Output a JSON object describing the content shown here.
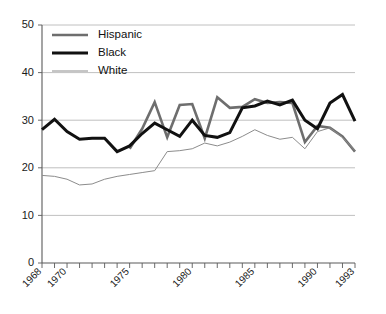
{
  "chart_data": {
    "type": "line",
    "title": "",
    "subtitle": "",
    "xlabel": "",
    "ylabel": "",
    "xlim": [
      1968,
      1993
    ],
    "ylim": [
      0,
      50
    ],
    "yticks": [
      0,
      10,
      20,
      30,
      40,
      50
    ],
    "xticks_labeled": [
      1968,
      1970,
      1975,
      1980,
      1985,
      1990,
      1993
    ],
    "xticks_all": [
      1968,
      1969,
      1970,
      1971,
      1972,
      1973,
      1974,
      1975,
      1976,
      1977,
      1978,
      1979,
      1980,
      1981,
      1982,
      1983,
      1984,
      1985,
      1986,
      1987,
      1988,
      1989,
      1990,
      1991,
      1992,
      1993
    ],
    "grid": "horizontal",
    "legend_position": "top-left",
    "series": [
      {
        "name": "Hispanic",
        "color": "#6e6e6e",
        "width": 2.6,
        "x": [
          1975,
          1976,
          1977,
          1978,
          1979,
          1980,
          1981,
          1982,
          1983,
          1984,
          1985,
          1986,
          1987,
          1988,
          1989,
          1990,
          1991,
          1992,
          1993
        ],
        "values": [
          24.0,
          28.2,
          33.8,
          26.4,
          33.2,
          33.4,
          26.2,
          34.8,
          32.6,
          32.8,
          34.4,
          33.6,
          33.8,
          33.6,
          25.4,
          28.8,
          28.4,
          26.6,
          23.4
        ]
      },
      {
        "name": "Black",
        "color": "#111111",
        "width": 3.0,
        "x": [
          1968,
          1969,
          1970,
          1971,
          1972,
          1973,
          1974,
          1975,
          1976,
          1977,
          1978,
          1979,
          1980,
          1981,
          1982,
          1983,
          1984,
          1985,
          1986,
          1987,
          1988,
          1989,
          1990,
          1991,
          1992,
          1993
        ],
        "values": [
          28.0,
          30.2,
          27.6,
          26.0,
          26.2,
          26.2,
          23.4,
          24.6,
          27.2,
          29.4,
          28.0,
          26.6,
          30.0,
          26.8,
          26.4,
          27.4,
          32.6,
          33.0,
          34.0,
          33.2,
          34.2,
          30.0,
          28.2,
          33.6,
          35.4,
          29.8
        ]
      },
      {
        "name": "White",
        "color": "#8c8c8c",
        "width": 1.0,
        "x": [
          1968,
          1969,
          1970,
          1971,
          1972,
          1973,
          1974,
          1975,
          1976,
          1977,
          1978,
          1979,
          1980,
          1981,
          1982,
          1983,
          1984,
          1985,
          1986,
          1987,
          1988,
          1989,
          1990,
          1991,
          1992,
          1993
        ],
        "values": [
          18.4,
          18.2,
          17.6,
          16.4,
          16.6,
          17.6,
          18.2,
          18.6,
          19.0,
          19.4,
          23.4,
          23.6,
          24.0,
          25.2,
          24.6,
          25.4,
          26.6,
          28.0,
          26.8,
          26.0,
          26.4,
          24.0,
          27.6,
          28.4,
          26.4,
          23.6
        ]
      }
    ],
    "legend_entries": [
      {
        "label": "Hispanic",
        "color": "#6e6e6e",
        "width": 2.6
      },
      {
        "label": "Black",
        "color": "#111111",
        "width": 3.0
      },
      {
        "label": "White",
        "color": "#8c8c8c",
        "width": 1.0
      }
    ],
    "colors": {
      "hispanic": "#6e6e6e",
      "black": "#111111",
      "white": "#8c8c8c",
      "grid": "#b9b9b9",
      "axis": "#5a5a5a",
      "background": "#ffffff"
    }
  }
}
